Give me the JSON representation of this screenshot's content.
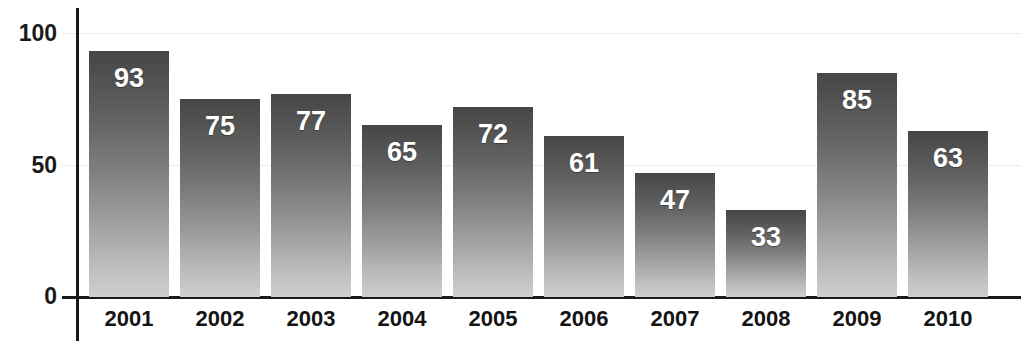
{
  "chart_data": {
    "type": "bar",
    "title": "",
    "xlabel": "",
    "ylabel": "",
    "categories": [
      "2001",
      "2002",
      "2003",
      "2004",
      "2005",
      "2006",
      "2007",
      "2008",
      "2009",
      "2010"
    ],
    "values": [
      93,
      75,
      77,
      65,
      72,
      61,
      47,
      33,
      85,
      63
    ],
    "ylim": [
      0,
      100
    ],
    "yticks": [
      "0",
      "50",
      "100"
    ],
    "ytick_values": [
      0,
      50,
      100
    ],
    "grid": true,
    "legend": false,
    "data_labels": true,
    "orientation": "vertical",
    "colors": {
      "bar_top": "#464646",
      "bar_bottom": "#cfcfcf",
      "axis": "#1a1a1a",
      "gridline": "#ececec",
      "data_label": "#ffffff",
      "category_label": "#141414",
      "background": "#ffffff"
    }
  },
  "axis": {
    "y_ticks": [
      {
        "label": "100"
      },
      {
        "label": "50"
      },
      {
        "label": "0"
      }
    ]
  },
  "bars": [
    {
      "category": "2001",
      "value": 93,
      "label": "93"
    },
    {
      "category": "2002",
      "value": 75,
      "label": "75"
    },
    {
      "category": "2003",
      "value": 77,
      "label": "77"
    },
    {
      "category": "2004",
      "value": 65,
      "label": "65"
    },
    {
      "category": "2005",
      "value": 72,
      "label": "72"
    },
    {
      "category": "2006",
      "value": 61,
      "label": "61"
    },
    {
      "category": "2007",
      "value": 47,
      "label": "47"
    },
    {
      "category": "2008",
      "value": 33,
      "label": "33"
    },
    {
      "category": "2009",
      "value": 85,
      "label": "85"
    },
    {
      "category": "2010",
      "value": 63,
      "label": "63"
    }
  ]
}
